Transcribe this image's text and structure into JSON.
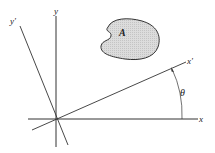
{
  "diagram": {
    "labels": {
      "x": "x",
      "y": "y",
      "x_prime": "x'",
      "y_prime": "y'",
      "area": "A",
      "angle": "θ"
    },
    "colors": {
      "axis": "#333333",
      "area_fill": "#d8d8d8",
      "area_stroke": "#333333"
    }
  }
}
